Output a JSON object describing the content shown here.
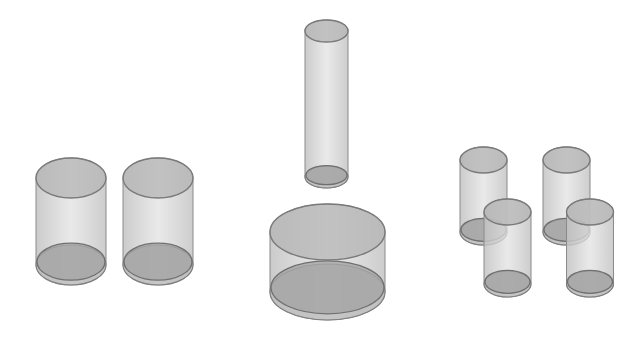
{
  "figure": {
    "groups": [
      {
        "id": "left",
        "label": "",
        "count": 2,
        "arrangement": "side-by-side, equal size"
      },
      {
        "id": "center",
        "label": "",
        "count": 2,
        "arrangement": "tall narrow cylinder above short wide cylinder"
      },
      {
        "id": "right",
        "label": "",
        "count": 4,
        "arrangement": "two overlapping pairs, staggered"
      }
    ],
    "colors": {
      "side_fill": "#d2d2d2",
      "top_fill": "#b4b4b4",
      "base_fill": "#a4a4a4",
      "outline": "#7a7a7a",
      "background": "#ffffff"
    }
  }
}
